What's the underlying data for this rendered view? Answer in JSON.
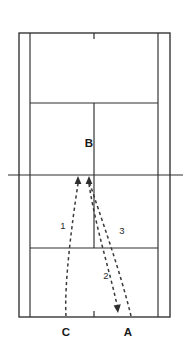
{
  "figure": {
    "kind": "tennis-court-shot-trajectory-diagram",
    "background_color": "#ffffff",
    "line_color": "#2e2e2e",
    "trajectory_color": "#3a3a3a",
    "label_color": "#1a1a1a"
  },
  "court": {
    "name": "tennis-court",
    "outer": {
      "x1": 19,
      "y1": 33,
      "x2": 170,
      "y2": 317
    },
    "singles_left_x": 30,
    "singles_right_x": 158,
    "service_line_top_y": 103,
    "service_line_bottom_y": 248,
    "center_service_line_x": 94,
    "net_y": 175,
    "net_x1": 8,
    "net_x2": 183,
    "center_mark_top": {
      "x": 94,
      "y1": 33,
      "y2": 39
    },
    "center_mark_bottom": {
      "x": 94,
      "y1": 311,
      "y2": 317
    }
  },
  "point_labels": [
    {
      "id": "label-b",
      "text": "B",
      "x": 89,
      "y": 147
    },
    {
      "id": "label-c",
      "text": "C",
      "x": 66,
      "y": 336
    },
    {
      "id": "label-a",
      "text": "A",
      "x": 128,
      "y": 336
    }
  ],
  "path_labels": [
    {
      "id": "label-1",
      "text": "1",
      "x": 63,
      "y": 229
    },
    {
      "id": "label-2",
      "text": "2",
      "x": 106,
      "y": 279
    },
    {
      "id": "label-3",
      "text": "3",
      "x": 122,
      "y": 234
    }
  ],
  "trajectories": [
    {
      "id": "trajectory-1",
      "label": "1",
      "from": "C",
      "to": "B",
      "direction": "up",
      "path": "M 66,316 C 64,286 72,222 78,184",
      "arrow": {
        "x": 78,
        "y": 177,
        "dir": "up"
      }
    },
    {
      "id": "trajectory-2",
      "label": "2",
      "from": "B",
      "to": "A",
      "direction": "down",
      "path": "M 89,184 C 95,225 110,272 117,305",
      "arrow": {
        "x": 118,
        "y": 312,
        "dir": "down"
      }
    },
    {
      "id": "trajectory-3",
      "label": "3",
      "from": "A",
      "to": "B",
      "direction": "up",
      "path": "M 131,316 C 120,270 100,215 90,184",
      "arrow": {
        "x": 89,
        "y": 177,
        "dir": "up"
      }
    }
  ]
}
